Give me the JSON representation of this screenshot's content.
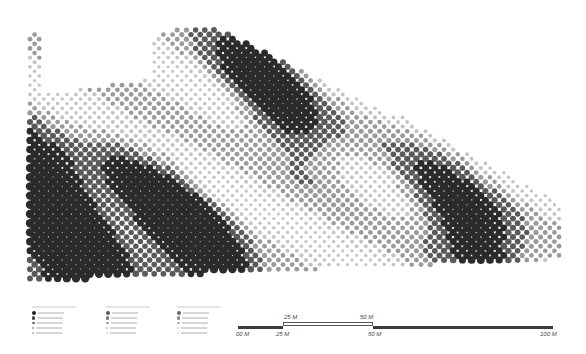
{
  "diagram": {
    "type": "halftone-dot-map",
    "palette": {
      "dark": "#2b2b2b",
      "mid": "#5a5a5a",
      "light": "#9a9a9a",
      "pale": "#c4c4c4"
    }
  },
  "legend": {
    "groups": [
      {
        "title": "",
        "swatches": [
          "#222222",
          "#444444",
          "#666666",
          "#999999",
          "#bbbbbb"
        ]
      },
      {
        "title": "",
        "swatches": [
          "#555555",
          "#777777",
          "#999999",
          "#bbbbbb",
          "#dddddd"
        ]
      },
      {
        "title": "",
        "swatches": [
          "#666666",
          "#888888",
          "#aaaaaa",
          "#cccccc",
          "#e0e0e0"
        ]
      }
    ]
  },
  "scale_bar": {
    "labels_bottom": [
      "00 M",
      "25 M",
      "50 M",
      "100 M"
    ],
    "labels_top": [
      "25 M",
      "50 M"
    ]
  }
}
